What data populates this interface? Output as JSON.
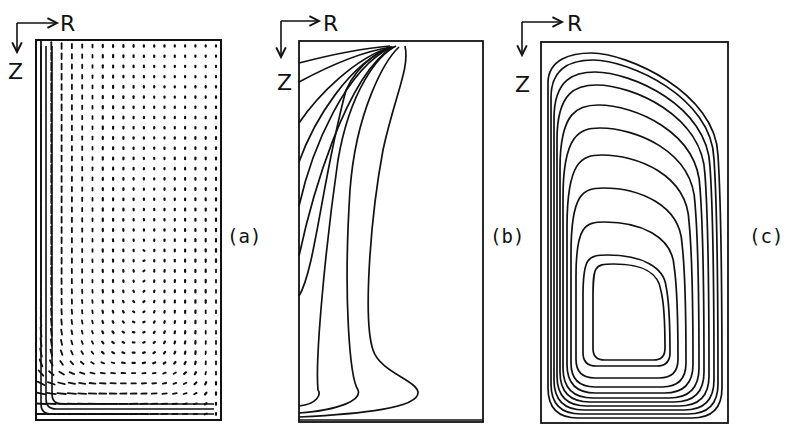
{
  "figure": {
    "panels": [
      {
        "id": "a",
        "label": "(a)",
        "type": "vector-field",
        "axis_r": "R",
        "axis_z": "Z"
      },
      {
        "id": "b",
        "label": "(b)",
        "type": "contour-lines",
        "axis_r": "R",
        "axis_z": "Z"
      },
      {
        "id": "c",
        "label": "(c)",
        "type": "streamlines",
        "axis_r": "R",
        "axis_z": "Z"
      }
    ]
  },
  "colors": {
    "ink": "#111111",
    "background": "#ffffff"
  }
}
